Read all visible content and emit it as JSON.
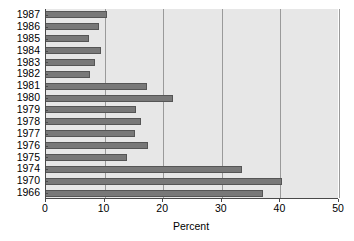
{
  "chart_data": {
    "type": "bar",
    "orientation": "horizontal",
    "title": "",
    "xlabel": "Percent",
    "ylabel": "",
    "xlim": [
      0,
      50
    ],
    "xticks": [
      0,
      10,
      20,
      30,
      40,
      50
    ],
    "grid": true,
    "legend": null,
    "categories": [
      "1987",
      "1986",
      "1985",
      "1984",
      "1983",
      "1982",
      "1981",
      "1980",
      "1979",
      "1978",
      "1977",
      "1976",
      "1975",
      "1974",
      "1970",
      "1966"
    ],
    "values": [
      10.4,
      9.0,
      7.3,
      9.4,
      8.3,
      7.5,
      17.2,
      21.7,
      15.3,
      16.2,
      15.2,
      17.4,
      13.9,
      33.5,
      40.3,
      37.0
    ],
    "series": [
      {
        "name": "Percent",
        "values": [
          10.4,
          9.0,
          7.3,
          9.4,
          8.3,
          7.5,
          17.2,
          21.7,
          15.3,
          16.2,
          15.2,
          17.4,
          13.9,
          33.5,
          40.3,
          37.0
        ]
      }
    ]
  },
  "style": {
    "plot_background": "#e7e7e7",
    "bar_fill": "#787878",
    "bar_edge": "#555555",
    "gridline_color": "#9a9a9a",
    "axis_color": "#4a4a4a",
    "page_background": "#ffffff",
    "text_color": "#000000"
  }
}
